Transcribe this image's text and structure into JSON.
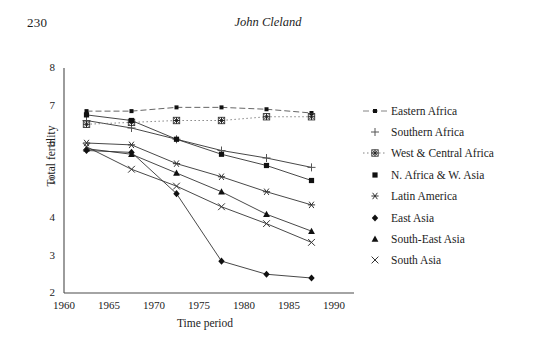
{
  "page": {
    "number": "230",
    "running_head": "John Cleland"
  },
  "chart_data": {
    "type": "line",
    "title": "",
    "xlabel": "Time period",
    "ylabel": "Total fertility",
    "xlim": [
      1960,
      1990
    ],
    "ylim": [
      2,
      8
    ],
    "xticks": [
      1960,
      1965,
      1970,
      1975,
      1980,
      1985,
      1990
    ],
    "yticks": [
      2,
      3,
      4,
      5,
      6,
      7,
      8
    ],
    "grid": false,
    "legend_position": "right",
    "x": [
      1962.5,
      1967.5,
      1972.5,
      1977.5,
      1982.5,
      1987.5
    ],
    "series": [
      {
        "name": "Eastern Africa",
        "marker": "small-filled-square",
        "linestyle": "dashed",
        "values": [
          6.85,
          6.85,
          6.95,
          6.95,
          6.9,
          6.8
        ]
      },
      {
        "name": "Southern Africa",
        "marker": "plus",
        "linestyle": "solid",
        "values": [
          6.6,
          6.4,
          6.1,
          5.8,
          5.6,
          5.35
        ]
      },
      {
        "name": "West & Central Africa",
        "marker": "asterisk-box",
        "linestyle": "dotted",
        "values": [
          6.5,
          6.55,
          6.6,
          6.6,
          6.7,
          6.7
        ]
      },
      {
        "name": "N. Africa & W. Asia",
        "marker": "filled-square",
        "linestyle": "solid",
        "values": [
          6.75,
          6.6,
          6.1,
          5.7,
          5.4,
          5.0
        ]
      },
      {
        "name": "Latin America",
        "marker": "star",
        "linestyle": "solid",
        "values": [
          6.0,
          5.95,
          5.45,
          5.1,
          4.7,
          4.35
        ]
      },
      {
        "name": "East Asia",
        "marker": "filled-diamond",
        "linestyle": "solid",
        "values": [
          5.8,
          5.75,
          4.65,
          2.85,
          2.5,
          2.4
        ]
      },
      {
        "name": "South-East Asia",
        "marker": "filled-triangle",
        "linestyle": "solid",
        "values": [
          5.85,
          5.7,
          5.2,
          4.7,
          4.1,
          3.65
        ]
      },
      {
        "name": "South Asia",
        "marker": "x-cross",
        "linestyle": "solid",
        "values": [
          5.9,
          5.3,
          4.85,
          4.3,
          3.85,
          3.35
        ]
      }
    ]
  }
}
